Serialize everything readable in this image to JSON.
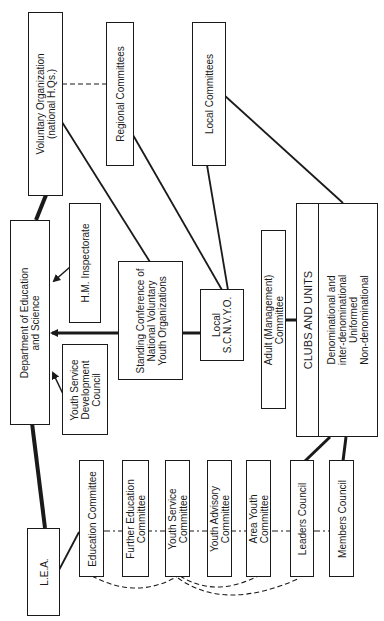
{
  "diagram": {
    "nodes": {
      "voluntary_org": {
        "lines": [
          "Voluntary Organization",
          "(national H.Qs.)"
        ]
      },
      "regional_committees": {
        "lines": [
          "Regional Committees"
        ]
      },
      "local_committees": {
        "lines": [
          "Local Committees"
        ]
      },
      "des": {
        "lines": [
          "Department of Education",
          "and Science"
        ]
      },
      "hm_inspectorate": {
        "lines": [
          "H.M. Inspectorate"
        ]
      },
      "standing_conference": {
        "lines": [
          "Standing Conference of",
          "National  Voluntary",
          "Youth Organizations"
        ]
      },
      "local_scnvyo": {
        "lines": [
          "Local",
          "S.C.N.V.Y.O."
        ]
      },
      "adult_committee": {
        "lines": [
          "Adult (Management)",
          "Committee"
        ]
      },
      "clubs_units": {
        "lines": [
          "CLUBS  AND  UNITS"
        ]
      },
      "club_types": {
        "lines": [
          "Denominational and",
          "inter-denominational",
          "Uniformed",
          "Non-denominational"
        ]
      },
      "ysdc": {
        "lines": [
          "Youth Service",
          "Development",
          "Council"
        ]
      },
      "lea": {
        "lines": [
          "L.E.A."
        ]
      },
      "education_committee": {
        "lines": [
          "Education Committee"
        ]
      },
      "further_education_committee": {
        "lines": [
          "Further Education",
          "Committee"
        ]
      },
      "youth_service_committee": {
        "lines": [
          "Youth Service",
          "Committee"
        ]
      },
      "youth_advisory_committee": {
        "lines": [
          "Youth Advisory",
          "Committee"
        ]
      },
      "area_youth_committee": {
        "lines": [
          "Area Youth",
          "Committee"
        ]
      },
      "leaders_council": {
        "lines": [
          "Leaders Council"
        ]
      },
      "members_council": {
        "lines": [
          "Members Council"
        ]
      }
    }
  }
}
